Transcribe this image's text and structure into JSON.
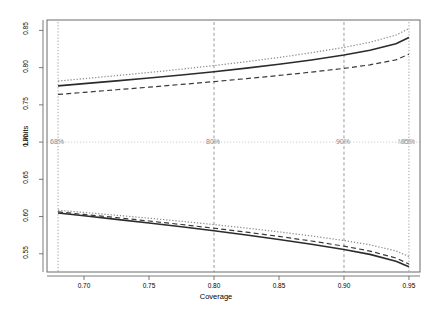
{
  "chart_data": {
    "type": "line",
    "title": "",
    "xlabel": "Coverage",
    "ylabel": "Limits",
    "xlim": [
      0.6715,
      0.9585
    ],
    "ylim": [
      0.5255,
      0.864
    ],
    "xticks": [
      0.7,
      0.75,
      0.8,
      0.85,
      0.9,
      0.95
    ],
    "xticklabels": [
      "0.70",
      "0.75",
      "0.80",
      "0.85",
      "0.90",
      "0.95"
    ],
    "yticks": [
      0.55,
      0.6,
      0.65,
      0.7,
      0.75,
      0.8,
      0.85
    ],
    "yticklabels": [
      "0.55",
      "0.60",
      "0.65",
      "0.70",
      "0.75",
      "0.80",
      "0.85"
    ],
    "grid": false,
    "legend_position": "none",
    "reference_lines": {
      "horizontal": [
        {
          "y": 0.7,
          "style": "dotted",
          "color": "#cccccc",
          "label": "MLE"
        }
      ],
      "vertical": [
        {
          "x": 0.68,
          "style": "dotted",
          "color": "#9a9a9a",
          "label": "68%"
        },
        {
          "x": 0.8,
          "style": "dashed",
          "color": "#8f8f8f",
          "label": "80%"
        },
        {
          "x": 0.9,
          "style": "dashed",
          "color": "#8f8f8f",
          "label": "90%"
        },
        {
          "x": 0.95,
          "style": "dotted",
          "color": "#9a9a9a",
          "label": "95%"
        }
      ]
    },
    "x": [
      0.68,
      0.7,
      0.725,
      0.75,
      0.775,
      0.8,
      0.825,
      0.85,
      0.875,
      0.9,
      0.92,
      0.94,
      0.95
    ],
    "series": [
      {
        "name": "upper-solid",
        "style": "solid",
        "color": "#2b2b2b",
        "width": 1.6,
        "values": [
          0.7755,
          0.7785,
          0.7822,
          0.786,
          0.7901,
          0.7945,
          0.7993,
          0.8045,
          0.8103,
          0.817,
          0.8233,
          0.832,
          0.8405
        ]
      },
      {
        "name": "upper-dashed",
        "style": "dashed",
        "color": "#3a3a3a",
        "width": 1.2,
        "values": [
          0.764,
          0.7668,
          0.7703,
          0.7738,
          0.7775,
          0.7812,
          0.7852,
          0.7895,
          0.794,
          0.799,
          0.8038,
          0.8105,
          0.818
        ]
      },
      {
        "name": "upper-dotted",
        "style": "dotted",
        "color": "#8c8c8c",
        "width": 1.2,
        "values": [
          0.782,
          0.7852,
          0.7893,
          0.7935,
          0.798,
          0.8028,
          0.808,
          0.8137,
          0.82,
          0.8272,
          0.834,
          0.8438,
          0.8525
        ]
      },
      {
        "name": "lower-solid",
        "style": "solid",
        "color": "#2b2b2b",
        "width": 1.6,
        "values": [
          0.6048,
          0.601,
          0.5962,
          0.5913,
          0.5862,
          0.5808,
          0.5752,
          0.5692,
          0.5628,
          0.5558,
          0.5492,
          0.54,
          0.5325
        ]
      },
      {
        "name": "lower-dashed",
        "style": "dashed",
        "color": "#3a3a3a",
        "width": 1.2,
        "values": [
          0.6062,
          0.6028,
          0.5985,
          0.594,
          0.5893,
          0.5843,
          0.579,
          0.5733,
          0.5671,
          0.5602,
          0.5536,
          0.5443,
          0.5362
        ]
      },
      {
        "name": "lower-dotted",
        "style": "dotted",
        "color": "#8c8c8c",
        "width": 1.2,
        "values": [
          0.6085,
          0.6055,
          0.6017,
          0.5978,
          0.5936,
          0.5892,
          0.5845,
          0.5794,
          0.5739,
          0.5678,
          0.562,
          0.5538,
          0.5462
        ]
      }
    ]
  },
  "axis": {
    "ylabel_text": "Limits",
    "xlabel_text": "Coverage"
  }
}
